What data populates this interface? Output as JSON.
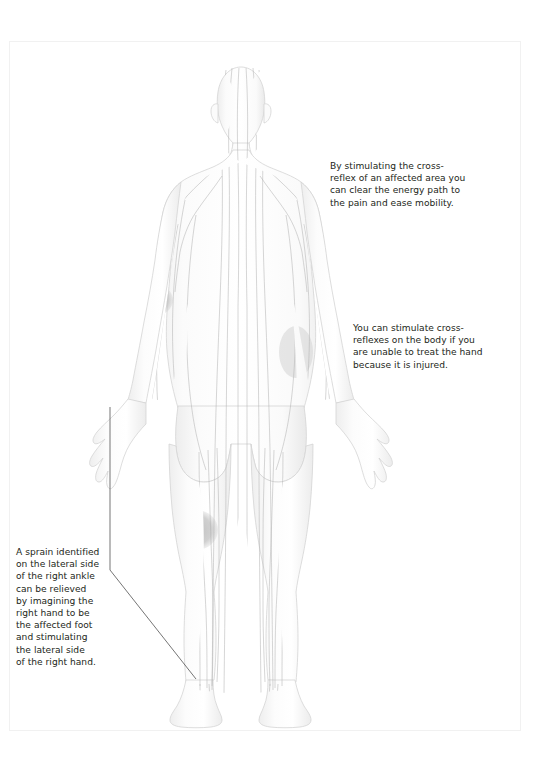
{
  "page": {
    "background_color": "#ffffff",
    "border_color": "#f1f1f1"
  },
  "figure": {
    "name": "human-body-posterior-meridian-diagram",
    "view": "posterior",
    "outline_color": "#d2d2d2",
    "meridian_line_color": "#b0b0b0",
    "body_fill_color": "#fcfcfc",
    "shading_color": "#f0f0f0",
    "highlight_color": "#c2c2c2",
    "highlights": [
      {
        "name": "left-upper-arm-highlight",
        "region": "left upper arm"
      },
      {
        "name": "right-wrist-highlight",
        "region": "right wrist"
      },
      {
        "name": "right-hip-highlight",
        "region": "right hip"
      },
      {
        "name": "left-knee-highlight",
        "region": "left knee"
      }
    ]
  },
  "callouts": [
    {
      "id": "cross-reflex",
      "text": "By stimulating the cross-\nreflex of an affected area you\ncan clear the energy path to\nthe pain and ease mobility."
    },
    {
      "id": "stimulate-body",
      "text": "You can stimulate cross-\nreflexes on the body if you\nare unable to treat the hand\nbecause it is injured."
    },
    {
      "id": "sprain",
      "text": "A sprain identified\non the lateral side\nof the right ankle\ncan be relieved\nby imagining the\nright hand to be\nthe affected foot\nand stimulating\nthe lateral side\nof the right hand."
    }
  ],
  "leader_lines": [
    {
      "name": "leader-line-hand-to-text",
      "from": "left hand",
      "to": "sprain callout"
    },
    {
      "name": "leader-line-text-to-ankle",
      "from": "sprain callout",
      "to": "left ankle"
    }
  ]
}
